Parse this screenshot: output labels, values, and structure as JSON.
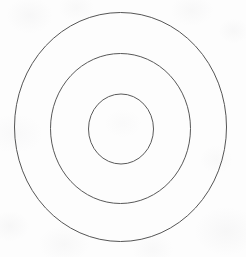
{
  "figure": {
    "kind": "line-drawing",
    "medium": "scanned paper",
    "canvas": {
      "width": 246,
      "height": 257
    },
    "background_color": "#fdfdfd",
    "stroke_color": "#555555",
    "fill": "none",
    "center": {
      "x": 120.5,
      "y": 127
    },
    "ring_count": 3,
    "rings": [
      {
        "name": "outer-ring",
        "label": "Outer circle",
        "cx": 120.5,
        "cy": 127,
        "rx": 106,
        "ry": 114.5,
        "stroke_color": "#555555",
        "stroke_width": 1,
        "fill": "none"
      },
      {
        "name": "middle-ring",
        "label": "Middle circle",
        "cx": 120.5,
        "cy": 128.5,
        "rx": 70,
        "ry": 75,
        "stroke_color": "#585858",
        "stroke_width": 1,
        "fill": "none"
      },
      {
        "name": "inner-ring",
        "label": "Inner circle",
        "cx": 121,
        "cy": 129,
        "rx": 32.5,
        "ry": 35,
        "stroke_color": "#5a5a5a",
        "stroke_width": 1,
        "fill": "none"
      }
    ]
  }
}
